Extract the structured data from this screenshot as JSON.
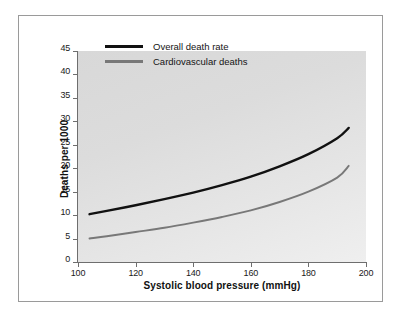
{
  "chart_data": {
    "type": "line",
    "title": "",
    "xlabel": "Systolic blood pressure (mmHg)",
    "ylabel": "Deaths per 1000",
    "xlim": [
      100,
      200
    ],
    "ylim": [
      0,
      45
    ],
    "xticks": [
      100,
      120,
      140,
      160,
      180,
      200
    ],
    "yticks": [
      0,
      5,
      10,
      15,
      20,
      25,
      30,
      35,
      40,
      45
    ],
    "grid": false,
    "legend_position": "top-left",
    "x": [
      104,
      110,
      120,
      130,
      140,
      150,
      160,
      170,
      180,
      190,
      194
    ],
    "series": [
      {
        "name": "Overall death rate",
        "color": "#111111",
        "values": [
          10.2,
          10.9,
          12.1,
          13.4,
          14.8,
          16.4,
          18.2,
          20.4,
          23.0,
          26.4,
          28.6
        ]
      },
      {
        "name": "Cardiovascular deaths",
        "color": "#787878",
        "values": [
          5.0,
          5.5,
          6.4,
          7.3,
          8.4,
          9.6,
          11.0,
          12.8,
          15.0,
          18.0,
          20.5
        ]
      }
    ]
  },
  "legend": {
    "entries": [
      {
        "label": "Overall death rate",
        "color": "#111111"
      },
      {
        "label": "Cardiovascular deaths",
        "color": "#787878"
      }
    ]
  },
  "axes": {
    "y_title": "Deaths per 1000",
    "x_title": "Systolic blood pressure (mmHg)",
    "y_tick_labels": [
      "45",
      "40",
      "35",
      "30",
      "25",
      "20",
      "15",
      "10",
      "5",
      "0"
    ],
    "x_tick_labels": [
      "100",
      "120",
      "140",
      "160",
      "180",
      "200"
    ]
  }
}
